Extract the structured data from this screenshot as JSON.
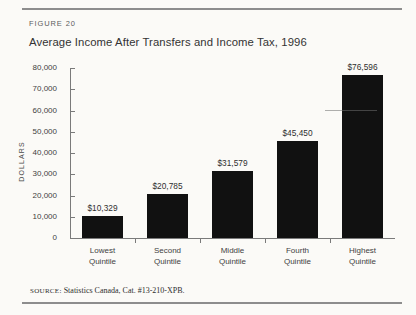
{
  "figure": {
    "label": "FIGURE 20",
    "title": "Average Income After Transfers and Income Tax, 1996",
    "source_word": "SOURCE:",
    "source_text": " Statistics Canada, Cat. #13-210-XPB."
  },
  "chart_data": {
    "type": "bar",
    "title": "Average Income After Transfers and Income Tax, 1996",
    "xlabel": "",
    "ylabel": "DOLLARS",
    "categories": [
      "Lowest\nQuintile",
      "Second\nQuintile",
      "Middle\nQuintile",
      "Fourth\nQuintile",
      "Highest\nQuintile"
    ],
    "category_lines": [
      [
        "Lowest",
        "Quintile"
      ],
      [
        "Second",
        "Quintile"
      ],
      [
        "Middle",
        "Quintile"
      ],
      [
        "Fourth",
        "Quintile"
      ],
      [
        "Highest",
        "Quintile"
      ]
    ],
    "values": [
      10329,
      20785,
      31579,
      45450,
      76596
    ],
    "value_labels": [
      "$10,329",
      "$20,785",
      "$31,579",
      "$45,450",
      "$76,596"
    ],
    "ylim": [
      0,
      80000
    ],
    "ytick_values": [
      0,
      10000,
      20000,
      30000,
      40000,
      50000,
      60000,
      70000,
      80000
    ],
    "ytick_labels": [
      "0",
      "10,000",
      "20,000",
      "30,000",
      "40,000",
      "50,000",
      "60,000",
      "70,000",
      "80,000"
    ],
    "grid": false,
    "legend": null,
    "bar_color": "#111111",
    "axis_color": "#7a7a7a"
  }
}
